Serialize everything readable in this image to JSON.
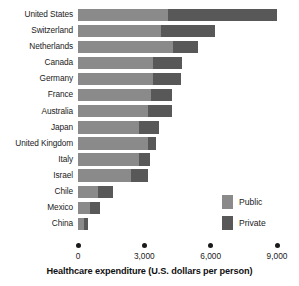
{
  "chart_data": {
    "type": "bar",
    "orientation": "horizontal",
    "stacked": true,
    "title": "",
    "xlabel": "Healthcare expenditure (U.S. dollars per person)",
    "ylabel": "",
    "xlim": [
      0,
      9000
    ],
    "xticks": [
      0,
      3000,
      6000,
      9000
    ],
    "xtick_labels": [
      "0",
      "3,000",
      "6,000",
      "9,000"
    ],
    "grid": false,
    "legend_position": "inside-right",
    "categories": [
      "United States",
      "Switzerland",
      "Netherlands",
      "Canada",
      "Germany",
      "France",
      "Australia",
      "Japan",
      "United Kingdom",
      "Italy",
      "Israel",
      "Chile",
      "Mexico",
      "China"
    ],
    "series": [
      {
        "name": "Public",
        "color": "#8a8a8a",
        "values": [
          4050,
          3750,
          4300,
          3400,
          3400,
          3300,
          3150,
          2750,
          3150,
          2750,
          2400,
          900,
          550,
          250
        ]
      },
      {
        "name": "Private",
        "color": "#585858",
        "values": [
          4950,
          2450,
          1150,
          1300,
          1250,
          950,
          1100,
          900,
          400,
          500,
          750,
          700,
          450,
          200
        ]
      }
    ],
    "totals": [
      9000,
      6200,
      5450,
      4700,
      4650,
      4250,
      4250,
      3650,
      3550,
      3250,
      3150,
      1600,
      1000,
      450
    ]
  },
  "legend": {
    "items": [
      {
        "label": "Public",
        "color": "#8a8a8a"
      },
      {
        "label": "Private",
        "color": "#585858"
      }
    ]
  },
  "axis": {
    "title": "Healthcare expenditure (U.S. dollars per person)"
  }
}
